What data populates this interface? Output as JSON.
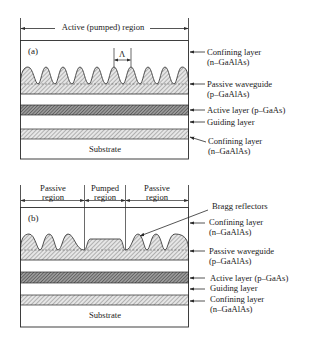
{
  "figure": {
    "panel_a": {
      "tag": "(a)",
      "dimension_label": "Active (pumped) region",
      "period_symbol": "Λ",
      "substrate_label": "Substrate",
      "layer_labels": [
        {
          "line1": "Confining layer",
          "line2": "(n–GaAlAs)"
        },
        {
          "line1": "Passive waveguide",
          "line2": "(p–GaAlAs)"
        },
        {
          "line1": "Active layer (p–GaAs)",
          "line2": ""
        },
        {
          "line1": "Guiding layer",
          "line2": ""
        },
        {
          "line1": "Confining layer",
          "line2": "(n–GaAlAs)"
        }
      ]
    },
    "panel_b": {
      "tag": "(b)",
      "regions": [
        {
          "line1": "Passive",
          "line2": "region"
        },
        {
          "line1": "Pumped",
          "line2": "region"
        },
        {
          "line1": "Passive",
          "line2": "region"
        }
      ],
      "callout": "Bragg reflectors",
      "substrate_label": "Substrate",
      "layer_labels": [
        {
          "line1": "Confining layer",
          "line2": "(n–GaAlAs)"
        },
        {
          "line1": "Passive waveguide",
          "line2": "(p–GaAlAs)"
        },
        {
          "line1": "Active layer (p–GaAs)",
          "line2": ""
        },
        {
          "line1": "Guiding layer",
          "line2": ""
        },
        {
          "line1": "Confining layer",
          "line2": "(n–GaAlAs)"
        }
      ]
    }
  },
  "colors": {
    "line": "#2a2a2a",
    "hatch_light": "#9a9a9a",
    "hatch_dark": "#555555"
  }
}
